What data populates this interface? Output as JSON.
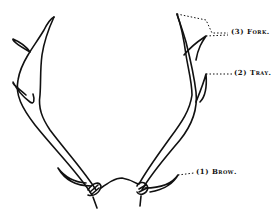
{
  "figure": {
    "type": "antler-diagram",
    "labels": [
      {
        "num": "(3)",
        "text": "Fork.",
        "x": 231,
        "y": 31
      },
      {
        "num": "(2)",
        "text": "Tray.",
        "x": 234,
        "y": 72
      },
      {
        "num": "(1)",
        "text": "Brow.",
        "x": 196,
        "y": 171
      }
    ],
    "colors": {
      "line": "#111111",
      "background": "#ffffff"
    }
  }
}
